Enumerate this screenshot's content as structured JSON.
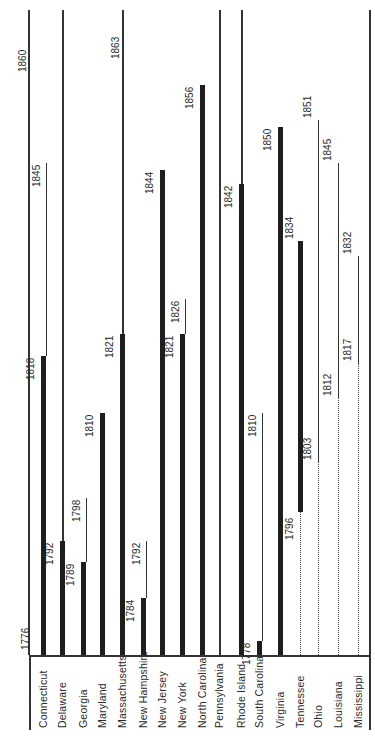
{
  "chart_data": {
    "type": "bar",
    "orientation": "rotated timeline (horizontal bars drawn vertically, page rotated 90°)",
    "title": "",
    "xlabel": "",
    "ylabel": "Year",
    "axis_range": [
      1776,
      1860
    ],
    "axis_ticks": [
      "1776",
      "1860"
    ],
    "grid": false,
    "legend": "none",
    "series_note": "Thick bar = property/taxpaying qualification period; thin line = later period; dotted line = period before statehood/qualification",
    "categories": [
      "Connecticut",
      "Delaware",
      "Georgia",
      "Maryland",
      "Massachusetts",
      "New Hampshire",
      "New Jersey",
      "New York",
      "North Carolina",
      "Pennsylvania",
      "Rhode Island",
      "South Carolina",
      "Virginia",
      "Tennessee",
      "Ohio",
      "Louisiana",
      "Mississippi"
    ],
    "states": [
      {
        "name": "Connecticut",
        "thick_end": 1818,
        "thin_end": 1845,
        "dotted_start": null,
        "labels": [
          "1818",
          "1845"
        ]
      },
      {
        "name": "Delaware",
        "thick_end": 1792,
        "thin_end": 1860,
        "dotted_start": null,
        "labels": [
          "1792"
        ]
      },
      {
        "name": "Georgia",
        "thick_end": 1789,
        "thin_end": 1798,
        "dotted_start": null,
        "labels": [
          "1789",
          "1798"
        ]
      },
      {
        "name": "Maryland",
        "thick_end": 1810,
        "thin_end": null,
        "dotted_start": null,
        "labels": [
          "1810"
        ]
      },
      {
        "name": "Massachusetts",
        "thick_end": 1821,
        "thin_end": 1863,
        "dotted_start": null,
        "labels": [
          "1821",
          "1863"
        ]
      },
      {
        "name": "New Hampshire",
        "thick_end": 1784,
        "thin_end": 1792,
        "dotted_start": null,
        "labels": [
          "1784",
          "1792"
        ]
      },
      {
        "name": "New Jersey",
        "thick_end": 1844,
        "thin_end": null,
        "dotted_start": null,
        "labels": [
          "1844"
        ]
      },
      {
        "name": "New York",
        "thick_end": 1821,
        "thin_end": 1826,
        "dotted_start": null,
        "labels": [
          "1821",
          "1826"
        ]
      },
      {
        "name": "North Carolina",
        "thick_end": 1856,
        "thin_end": null,
        "dotted_start": null,
        "labels": [
          "1856"
        ]
      },
      {
        "name": "Pennsylvania",
        "thick_end": null,
        "thin_end": 1860,
        "dotted_start": null,
        "labels": []
      },
      {
        "name": "Rhode Island",
        "thick_end": 1842,
        "thin_end": 1860,
        "dotted_start": null,
        "labels": [
          "1842"
        ]
      },
      {
        "name": "South Carolina",
        "thick_end": 1778,
        "thin_end": 1810,
        "dotted_start": null,
        "labels": [
          "1778",
          "1810"
        ]
      },
      {
        "name": "Virginia",
        "thick_end": 1850,
        "thin_end": null,
        "dotted_start": null,
        "labels": [
          "1850"
        ]
      },
      {
        "name": "Tennessee",
        "thick_start": 1796,
        "thick_end": 1834,
        "dotted_end": 1796,
        "labels": [
          "1796",
          "1834"
        ]
      },
      {
        "name": "Ohio",
        "thin_start": 1803,
        "thin_end": 1851,
        "dotted_end": 1803,
        "labels": [
          "1803",
          "1851"
        ]
      },
      {
        "name": "Louisiana",
        "thin_start": 1812,
        "thin_end": 1845,
        "dotted_end": 1812,
        "labels": [
          "1812",
          "1845"
        ]
      },
      {
        "name": "Mississippi",
        "thin_start": 1817,
        "thin_end": 1832,
        "dotted_end": 1817,
        "labels": [
          "1817",
          "1832"
        ]
      }
    ]
  },
  "axis": {
    "start_label": "1776",
    "end_label": "1860"
  }
}
